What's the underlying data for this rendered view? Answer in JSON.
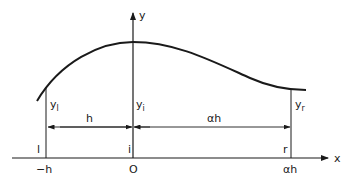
{
  "diagram": {
    "axes": {
      "x_label": "x",
      "y_label": "y"
    },
    "ordinates": {
      "left": {
        "base": "y",
        "sub": "l"
      },
      "middle": {
        "base": "y",
        "sub": "i"
      },
      "right": {
        "base": "y",
        "sub": "r"
      }
    },
    "spacing": {
      "left": "h",
      "right": "αh"
    },
    "point_labels": {
      "left": "l",
      "middle": "i",
      "right": "r"
    },
    "tick_labels": {
      "left": "−h",
      "origin": "O",
      "right": "αh"
    },
    "colors": {
      "line": "#1a1a1a",
      "background": "#ffffff"
    }
  }
}
